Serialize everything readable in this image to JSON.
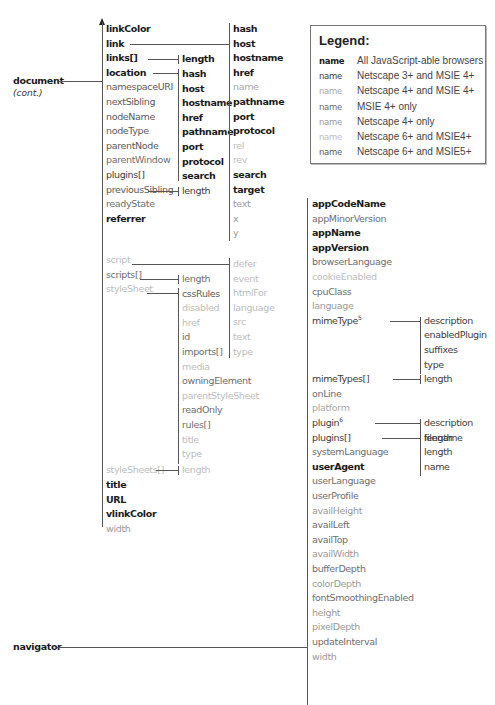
{
  "roots": {
    "document": {
      "label": "document",
      "note": "(cont.)"
    },
    "navigator": {
      "label": "navigator"
    }
  },
  "legend": {
    "title": "Legend:",
    "rows": [
      {
        "sample": "name",
        "style": "all",
        "desc": "All JavaScript-able browsers"
      },
      {
        "sample": "name",
        "style": "ns3",
        "desc": "Netscape 3+ and MSIE 4+"
      },
      {
        "sample": "name",
        "style": "ns4ie4",
        "desc": "Netscape 4+ and MSIE 4+"
      },
      {
        "sample": "name",
        "style": "ie4",
        "desc": "MSIE 4+ only"
      },
      {
        "sample": "name",
        "style": "ns4",
        "desc": "Netscape 4+ only"
      },
      {
        "sample": "name",
        "style": "ns6ie4",
        "desc": "Netscape 6+ and MSIE4+"
      },
      {
        "sample": "name",
        "style": "ns6ie5",
        "desc": "Netscape 6+ and MSIE5+"
      }
    ]
  },
  "document_props": [
    {
      "label": "linkColor",
      "style": "all"
    },
    {
      "label": "link",
      "style": "all"
    },
    {
      "label": "links[]",
      "style": "all"
    },
    {
      "label": "location",
      "style": "all"
    },
    {
      "label": "namespaceURI",
      "style": "ns6ie5"
    },
    {
      "label": "nextSibling",
      "style": "ns6ie5"
    },
    {
      "label": "nodeName",
      "style": "ns6ie5"
    },
    {
      "label": "nodeType",
      "style": "ns6ie5"
    },
    {
      "label": "parentNode",
      "style": "ns6ie5"
    },
    {
      "label": "parentWindow",
      "style": "ie4"
    },
    {
      "label": "plugins[]",
      "style": "ns3"
    },
    {
      "label": "previousSibling",
      "style": "ns6ie5"
    },
    {
      "label": "readyState",
      "style": "ie4"
    },
    {
      "label": "referrer",
      "style": "all"
    },
    {
      "label": "script",
      "style": "ns6ie4"
    },
    {
      "label": "scripts[]",
      "style": "ie4"
    },
    {
      "label": "styleSheet",
      "style": "ns6ie4"
    },
    {
      "label": "styleSheets[]",
      "style": "ns6ie4"
    },
    {
      "label": "title",
      "style": "all"
    },
    {
      "label": "URL",
      "style": "all"
    },
    {
      "label": "vlinkColor",
      "style": "all"
    },
    {
      "label": "width",
      "style": "ns4"
    }
  ],
  "links_children": [
    {
      "label": "length",
      "style": "all"
    }
  ],
  "location_children": [
    {
      "label": "hash",
      "style": "all"
    },
    {
      "label": "host",
      "style": "all"
    },
    {
      "label": "hostname",
      "style": "all"
    },
    {
      "label": "href",
      "style": "all"
    },
    {
      "label": "pathname",
      "style": "all"
    },
    {
      "label": "port",
      "style": "all"
    },
    {
      "label": "protocol",
      "style": "all"
    },
    {
      "label": "search",
      "style": "all"
    }
  ],
  "plugins_children": [
    {
      "label": "length",
      "style": "ns3"
    }
  ],
  "link_children": [
    {
      "label": "hash",
      "style": "all"
    },
    {
      "label": "host",
      "style": "all"
    },
    {
      "label": "hostname",
      "style": "all"
    },
    {
      "label": "href",
      "style": "all"
    },
    {
      "label": "name",
      "style": "ns4ie4"
    },
    {
      "label": "pathname",
      "style": "all"
    },
    {
      "label": "port",
      "style": "all"
    },
    {
      "label": "protocol",
      "style": "all"
    },
    {
      "label": "rel",
      "style": "ns6ie4"
    },
    {
      "label": "rev",
      "style": "ns6ie4"
    },
    {
      "label": "search",
      "style": "all"
    },
    {
      "label": "target",
      "style": "all"
    },
    {
      "label": "text",
      "style": "ns4"
    },
    {
      "label": "x",
      "style": "ns4"
    },
    {
      "label": "y",
      "style": "ns4"
    }
  ],
  "script_children": [
    {
      "label": "defer",
      "style": "ns6ie4"
    },
    {
      "label": "event",
      "style": "ns6ie4"
    },
    {
      "label": "htmlFor",
      "style": "ns6ie4"
    },
    {
      "label": "language",
      "style": "ns6ie4"
    },
    {
      "label": "src",
      "style": "ns6ie4"
    },
    {
      "label": "text",
      "style": "ns6ie4"
    },
    {
      "label": "type",
      "style": "ns6ie4"
    }
  ],
  "scripts_children": [
    {
      "label": "length",
      "style": "ie4"
    }
  ],
  "stylesheet_children": [
    {
      "label": "cssRules",
      "style": "ns6ie5"
    },
    {
      "label": "disabled",
      "style": "ns6ie4"
    },
    {
      "label": "href",
      "style": "ns6ie4"
    },
    {
      "label": "id",
      "style": "ie4"
    },
    {
      "label": "imports[]",
      "style": "ie4"
    },
    {
      "label": "media",
      "style": "ns6ie4"
    },
    {
      "label": "owningElement",
      "style": "ie4"
    },
    {
      "label": "parentStyleSheet",
      "style": "ns6ie4"
    },
    {
      "label": "readOnly",
      "style": "ie4"
    },
    {
      "label": "rules[]",
      "style": "ie4"
    },
    {
      "label": "title",
      "style": "ns6ie4"
    },
    {
      "label": "type",
      "style": "ns6ie4"
    }
  ],
  "stylesheets_children": [
    {
      "label": "length",
      "style": "ns6ie4"
    }
  ],
  "navigator_props": [
    {
      "label": "appCodeName",
      "style": "all"
    },
    {
      "label": "appMinorVersion",
      "style": "ie4"
    },
    {
      "label": "appName",
      "style": "all"
    },
    {
      "label": "appVersion",
      "style": "all"
    },
    {
      "label": "browserLanguage",
      "style": "ie4"
    },
    {
      "label": "cookieEnabled",
      "style": "ns6ie4"
    },
    {
      "label": "cpuClass",
      "style": "ie4"
    },
    {
      "label": "language",
      "style": "ns4"
    },
    {
      "label": "mimeType",
      "sup": "5",
      "style": "ns3"
    },
    {
      "label": "mimeTypes[]",
      "style": "ns3"
    },
    {
      "label": "onLine",
      "style": "ie4"
    },
    {
      "label": "platform",
      "style": "ns4ie4"
    },
    {
      "label": "plugin",
      "sup": "6",
      "style": "ns3"
    },
    {
      "label": "plugins[]",
      "style": "ns3"
    },
    {
      "label": "systemLanguage",
      "style": "ie4"
    },
    {
      "label": "userAgent",
      "style": "all"
    },
    {
      "label": "userLanguage",
      "style": "ie4"
    },
    {
      "label": "userProfile",
      "style": "ie4"
    },
    {
      "label": "availHeight",
      "style": "ns4"
    },
    {
      "label": "availLeft",
      "style": "ie4"
    },
    {
      "label": "availTop",
      "style": "ie4"
    },
    {
      "label": "availWidth",
      "style": "ns4"
    },
    {
      "label": "bufferDepth",
      "style": "ie4"
    },
    {
      "label": "colorDepth",
      "style": "ns4"
    },
    {
      "label": "fontSmoothingEnabled",
      "style": "ie4"
    },
    {
      "label": "height",
      "style": "ns4"
    },
    {
      "label": "pixelDepth",
      "style": "ns4"
    },
    {
      "label": "updateInterval",
      "style": "ie4"
    },
    {
      "label": "width",
      "style": "ns4"
    }
  ],
  "mimetype_children": [
    {
      "label": "description",
      "style": "ns3"
    },
    {
      "label": "enabledPlugin",
      "style": "ns3"
    },
    {
      "label": "suffixes",
      "style": "ns3"
    },
    {
      "label": "type",
      "style": "ns3"
    }
  ],
  "mimetypes_children": [
    {
      "label": "length",
      "style": "ns3"
    }
  ],
  "plugin_children": [
    {
      "label": "description",
      "style": "ns3"
    },
    {
      "label": "filename",
      "style": "ns3"
    },
    {
      "label": "length",
      "style": "ns3"
    },
    {
      "label": "name",
      "style": "ns3"
    }
  ],
  "nav_plugins_children": [
    {
      "label": "length",
      "style": "ns3"
    }
  ]
}
